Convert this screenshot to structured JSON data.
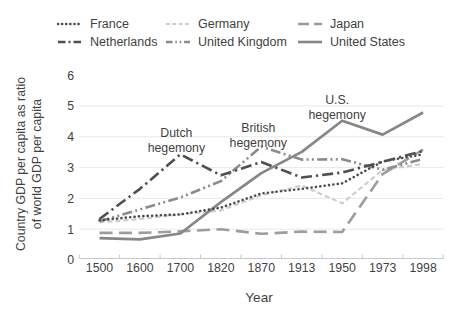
{
  "figure": {
    "background": "#ffffff",
    "text_color": "#3f3f3f",
    "axis_color": "#c9c9c9",
    "gridline_color": "#e9e9e9"
  },
  "chart_data": {
    "type": "line",
    "title": "",
    "xlabel": "Year",
    "ylabel_lines": [
      "Country GDP per capita as ratio",
      "of world GDP per capita"
    ],
    "x_categories": [
      "1500",
      "1600",
      "1700",
      "1820",
      "1870",
      "1913",
      "1950",
      "1973",
      "1998"
    ],
    "yticks": [
      "0",
      "1",
      "2",
      "3",
      "4",
      "5",
      "6"
    ],
    "ylim": [
      0,
      6
    ],
    "grid": "horizontal",
    "legend_position": "top",
    "series": [
      {
        "name": "France",
        "color": "#4b4b4b",
        "dash": "dot",
        "values": [
          1.29,
          1.42,
          1.48,
          1.7,
          2.16,
          2.31,
          2.49,
          3.2,
          3.43
        ]
      },
      {
        "name": "Germany",
        "color": "#cccccc",
        "dash": "dash",
        "values": [
          1.22,
          1.33,
          1.48,
          1.61,
          2.1,
          2.42,
          1.84,
          2.92,
          3.12
        ]
      },
      {
        "name": "Japan",
        "color": "#9d9d9d",
        "dash": "longdash",
        "values": [
          0.88,
          0.88,
          0.93,
          1.0,
          0.85,
          0.92,
          0.91,
          2.79,
          3.58
        ]
      },
      {
        "name": "Netherlands",
        "color": "#4f4f4f",
        "dash": "dashdot",
        "values": [
          1.33,
          2.31,
          3.43,
          2.75,
          3.18,
          2.68,
          2.84,
          3.19,
          3.54
        ]
      },
      {
        "name": "United Kingdom",
        "color": "#8b8b8b",
        "dash": "dashdotdot",
        "values": [
          1.26,
          1.64,
          2.03,
          2.56,
          3.68,
          3.26,
          3.27,
          2.93,
          3.28
        ]
      },
      {
        "name": "United States",
        "color": "#878787",
        "dash": "solid",
        "values": [
          0.71,
          0.67,
          0.86,
          1.88,
          2.82,
          3.51,
          4.52,
          4.07,
          4.79
        ]
      }
    ],
    "annotations": [
      {
        "lines": [
          "Dutch",
          "hegemony"
        ],
        "year": "1700",
        "value": 4.12,
        "dx": -4
      },
      {
        "lines": [
          "British",
          "hegemony"
        ],
        "year": "1870",
        "value": 4.29,
        "dx": -3
      },
      {
        "lines": [
          "U.S.",
          "hegemony"
        ],
        "year": "1950",
        "value": 5.19,
        "dx": -5
      }
    ]
  }
}
